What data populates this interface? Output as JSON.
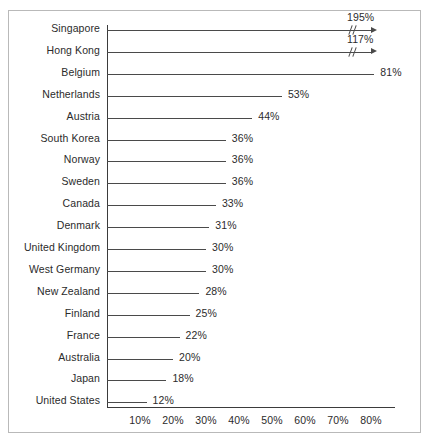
{
  "chart_data": {
    "type": "bar",
    "orientation": "horizontal",
    "title": "",
    "subtitle": "",
    "xlabel": "",
    "ylabel": "",
    "grid": false,
    "legend": null,
    "axis_ticks": [
      "10%",
      "20%",
      "30%",
      "40%",
      "50%",
      "60%",
      "70%",
      "80%"
    ],
    "axis_tick_values": [
      10,
      20,
      30,
      40,
      50,
      60,
      70,
      80
    ],
    "xlim": [
      0,
      87
    ],
    "axis_broken": true,
    "axis_break_note": "Singapore and Hong Kong exceed the plotted axis range and are drawn with a double-slash break mark and an arrow head.",
    "categories": [
      "Singapore",
      "Hong Kong",
      "Belgium",
      "Netherlands",
      "Austria",
      "South Korea",
      "Norway",
      "Sweden",
      "Canada",
      "Denmark",
      "United Kingdom",
      "West Germany",
      "New Zealand",
      "Finland",
      "France",
      "Australia",
      "Japan",
      "United States"
    ],
    "values": [
      195,
      117,
      81,
      53,
      44,
      36,
      36,
      36,
      33,
      31,
      30,
      30,
      28,
      25,
      22,
      20,
      18,
      12
    ],
    "value_labels": [
      "195%",
      "117%",
      "81%",
      "53%",
      "44%",
      "36%",
      "36%",
      "36%",
      "33%",
      "31%",
      "30%",
      "30%",
      "28%",
      "25%",
      "22%",
      "20%",
      "18%",
      "12%"
    ],
    "clipped": [
      true,
      true,
      false,
      false,
      false,
      false,
      false,
      false,
      false,
      false,
      false,
      false,
      false,
      false,
      false,
      false,
      false,
      false
    ],
    "colors": {
      "line": "#4a4a4a",
      "axis": "#3b3b3b",
      "text": "#2b2b2b",
      "frame": "#b9b9b9",
      "background": "#ffffff"
    }
  }
}
